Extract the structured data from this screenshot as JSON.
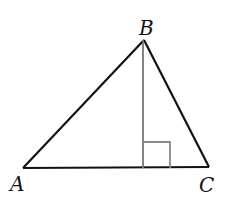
{
  "diagram": {
    "type": "triangle-with-altitude",
    "colors": {
      "sides": "#111111",
      "altitude": "#777777",
      "right_angle_marker": "#888888",
      "labels": "#111111"
    },
    "vertices": {
      "A": {
        "label": "A",
        "x": 23,
        "y": 168
      },
      "B": {
        "label": "B",
        "x": 144,
        "y": 40
      },
      "C": {
        "label": "C",
        "x": 209,
        "y": 167
      }
    },
    "altitude": {
      "from": "B",
      "foot_x": 143,
      "foot_y": 168
    },
    "right_angle_marker": {
      "x": 143,
      "y": 142,
      "size": 26
    },
    "labels": {
      "A": "A",
      "B": "B",
      "C": "C"
    }
  }
}
